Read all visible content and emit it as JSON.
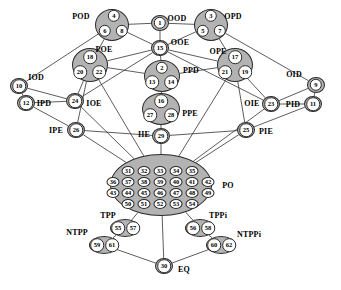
{
  "diagram": {
    "canvas": {
      "width": 341,
      "height": 290
    },
    "style": {
      "node_fill": "#b3b3b3",
      "node_stroke": "#2b2b2b",
      "cell_fill": "#ffffff",
      "edge_color": "#333333",
      "background": "#ffffff"
    },
    "nodes": [
      {
        "id": "OOD",
        "label": "OOD",
        "label_x": 177,
        "label_y": 19,
        "cx": 160,
        "cy": 23,
        "rx": 9,
        "ry": 8,
        "cells": [
          {
            "t": "1",
            "x": 160,
            "y": 23,
            "r": 6.2
          }
        ]
      },
      {
        "id": "POD",
        "label": "POD",
        "label_x": 81,
        "label_y": 17,
        "cx": 112,
        "cy": 25,
        "rx": 17,
        "ry": 16,
        "cells": [
          {
            "t": "4",
            "x": 114,
            "y": 16,
            "r": 6.2
          },
          {
            "t": "6",
            "x": 105,
            "y": 31,
            "r": 6.2
          },
          {
            "t": "8",
            "x": 122,
            "y": 31,
            "r": 6.2
          }
        ]
      },
      {
        "id": "OPD",
        "label": "OPD",
        "label_x": 233,
        "label_y": 17,
        "cx": 211,
        "cy": 25,
        "rx": 17,
        "ry": 16,
        "cells": [
          {
            "t": "3",
            "x": 211,
            "y": 16,
            "r": 6.2
          },
          {
            "t": "5",
            "x": 203,
            "y": 31,
            "r": 6.2
          },
          {
            "t": "7",
            "x": 220,
            "y": 31,
            "r": 6.2
          }
        ]
      },
      {
        "id": "OOE",
        "label": "OOE",
        "label_x": 180,
        "label_y": 43,
        "cx": 160,
        "cy": 48,
        "rx": 9,
        "ry": 8,
        "cells": [
          {
            "t": "15",
            "x": 160,
            "y": 48,
            "r": 6.8
          }
        ]
      },
      {
        "id": "POE",
        "label": "POE",
        "label_x": 104,
        "label_y": 50,
        "cx": 90,
        "cy": 65,
        "rx": 18,
        "ry": 17,
        "cells": [
          {
            "t": "18",
            "x": 90,
            "y": 57,
            "r": 6.8
          },
          {
            "t": "20",
            "x": 80,
            "y": 72,
            "r": 6.8
          },
          {
            "t": "22",
            "x": 99,
            "y": 72,
            "r": 6.8
          }
        ]
      },
      {
        "id": "OPE",
        "label": "OPE",
        "label_x": 218,
        "label_y": 52,
        "cx": 235,
        "cy": 65,
        "rx": 18,
        "ry": 17,
        "cells": [
          {
            "t": "17",
            "x": 235,
            "y": 57,
            "r": 6.8
          },
          {
            "t": "21",
            "x": 225,
            "y": 72,
            "r": 6.8
          },
          {
            "t": "19",
            "x": 245,
            "y": 72,
            "r": 6.8
          }
        ]
      },
      {
        "id": "PPD",
        "label": "PPD",
        "label_x": 191,
        "label_y": 71,
        "cx": 162,
        "cy": 76,
        "rx": 18,
        "ry": 16,
        "cells": [
          {
            "t": "2",
            "x": 162,
            "y": 68,
            "r": 6.2
          },
          {
            "t": "13",
            "x": 152,
            "y": 82,
            "r": 6.8
          },
          {
            "t": "14",
            "x": 171,
            "y": 82,
            "r": 6.8
          }
        ]
      },
      {
        "id": "IOD",
        "label": "IOD",
        "label_x": 36,
        "label_y": 78,
        "cx": 19,
        "cy": 86,
        "rx": 9,
        "ry": 8,
        "cells": [
          {
            "t": "10",
            "x": 19,
            "y": 86,
            "r": 6.8
          }
        ]
      },
      {
        "id": "OID",
        "label": "OID",
        "label_x": 294,
        "label_y": 75,
        "cx": 316,
        "cy": 85,
        "rx": 9,
        "ry": 8,
        "cells": [
          {
            "t": "9",
            "x": 316,
            "y": 85,
            "r": 6.2
          }
        ]
      },
      {
        "id": "PPE",
        "label": "PPE",
        "label_x": 190,
        "label_y": 114,
        "cx": 161,
        "cy": 109,
        "rx": 19,
        "ry": 16,
        "cells": [
          {
            "t": "16",
            "x": 161,
            "y": 101,
            "r": 6.8
          },
          {
            "t": "27",
            "x": 150,
            "y": 115,
            "r": 6.8
          },
          {
            "t": "28",
            "x": 171,
            "y": 115,
            "r": 6.8
          }
        ]
      },
      {
        "id": "IPD",
        "label": "IPD",
        "label_x": 44,
        "label_y": 104,
        "cx": 26,
        "cy": 103,
        "rx": 9,
        "ry": 8,
        "cells": [
          {
            "t": "12",
            "x": 26,
            "y": 103,
            "r": 6.8
          }
        ]
      },
      {
        "id": "IOE",
        "label": "IOE",
        "label_x": 94,
        "label_y": 104,
        "cx": 75,
        "cy": 101,
        "rx": 9,
        "ry": 8,
        "cells": [
          {
            "t": "24",
            "x": 75,
            "y": 101,
            "r": 6.8
          }
        ]
      },
      {
        "id": "OIE",
        "label": "OIE",
        "label_x": 252,
        "label_y": 104,
        "cx": 271,
        "cy": 104,
        "rx": 9,
        "ry": 8,
        "cells": [
          {
            "t": "23",
            "x": 271,
            "y": 104,
            "r": 6.8
          }
        ]
      },
      {
        "id": "PID",
        "label": "PID",
        "label_x": 293,
        "label_y": 105,
        "cx": 313,
        "cy": 104,
        "rx": 9,
        "ry": 8,
        "cells": [
          {
            "t": "11",
            "x": 313,
            "y": 104,
            "r": 6.8
          }
        ]
      },
      {
        "id": "IIE",
        "label": "IIE",
        "label_x": 144,
        "label_y": 135,
        "cx": 161,
        "cy": 136,
        "rx": 9,
        "ry": 8,
        "cells": [
          {
            "t": "29",
            "x": 161,
            "y": 136,
            "r": 6.8
          }
        ]
      },
      {
        "id": "IPE",
        "label": "IPE",
        "label_x": 56,
        "label_y": 131,
        "cx": 76,
        "cy": 130,
        "rx": 9,
        "ry": 8,
        "cells": [
          {
            "t": "26",
            "x": 76,
            "y": 130,
            "r": 6.8
          }
        ]
      },
      {
        "id": "PIE",
        "label": "PIE",
        "label_x": 266,
        "label_y": 132,
        "cx": 246,
        "cy": 130,
        "rx": 9,
        "ry": 8,
        "cells": [
          {
            "t": "25",
            "x": 246,
            "y": 130,
            "r": 6.8
          }
        ]
      },
      {
        "id": "PO",
        "label": "PO",
        "label_x": 228,
        "label_y": 186,
        "cx": 161,
        "cy": 185,
        "rx": 51,
        "ry": 31,
        "cells": []
      },
      {
        "id": "TPP",
        "label": "TPP",
        "label_x": 108,
        "label_y": 216,
        "cx": 125,
        "cy": 228,
        "rx": 15,
        "ry": 9,
        "cells": [
          {
            "t": "55",
            "x": 118,
            "y": 228,
            "r": 6.8
          },
          {
            "t": "57",
            "x": 133,
            "y": 228,
            "r": 6.8
          }
        ]
      },
      {
        "id": "TPPi",
        "label": "TPPi",
        "label_x": 218,
        "label_y": 216,
        "cx": 200,
        "cy": 228,
        "rx": 15,
        "ry": 9,
        "cells": [
          {
            "t": "56",
            "x": 193,
            "y": 228,
            "r": 6.8
          },
          {
            "t": "58",
            "x": 208,
            "y": 228,
            "r": 6.8
          }
        ]
      },
      {
        "id": "NTPP",
        "label": "NTPP",
        "label_x": 77,
        "label_y": 233,
        "cx": 104,
        "cy": 245,
        "rx": 15,
        "ry": 9,
        "cells": [
          {
            "t": "59",
            "x": 97,
            "y": 245,
            "r": 6.8
          },
          {
            "t": "61",
            "x": 112,
            "y": 245,
            "r": 6.8
          }
        ]
      },
      {
        "id": "NTPPi",
        "label": "NTPPi",
        "label_x": 249,
        "label_y": 235,
        "cx": 221,
        "cy": 245,
        "rx": 15,
        "ry": 9,
        "cells": [
          {
            "t": "60",
            "x": 214,
            "y": 245,
            "r": 6.8
          },
          {
            "t": "62",
            "x": 229,
            "y": 245,
            "r": 6.8
          }
        ]
      },
      {
        "id": "EQ",
        "label": "EQ",
        "label_x": 184,
        "label_y": 270,
        "cx": 164,
        "cy": 266,
        "rx": 9,
        "ry": 8,
        "cells": [
          {
            "t": "30",
            "x": 164,
            "y": 266,
            "r": 6.8
          }
        ]
      }
    ],
    "po_numbers": [
      {
        "t": "31",
        "x": 128,
        "y": 171
      },
      {
        "t": "32",
        "x": 144,
        "y": 171
      },
      {
        "t": "33",
        "x": 160,
        "y": 171
      },
      {
        "t": "34",
        "x": 176,
        "y": 171
      },
      {
        "t": "35",
        "x": 192,
        "y": 171
      },
      {
        "t": "36",
        "x": 113,
        "y": 182
      },
      {
        "t": "37",
        "x": 128,
        "y": 182
      },
      {
        "t": "38",
        "x": 144,
        "y": 182
      },
      {
        "t": "39",
        "x": 160,
        "y": 182
      },
      {
        "t": "40",
        "x": 176,
        "y": 182
      },
      {
        "t": "41",
        "x": 192,
        "y": 182
      },
      {
        "t": "42",
        "x": 208,
        "y": 182
      },
      {
        "t": "43",
        "x": 113,
        "y": 193
      },
      {
        "t": "44",
        "x": 128,
        "y": 193
      },
      {
        "t": "45",
        "x": 144,
        "y": 193
      },
      {
        "t": "46",
        "x": 160,
        "y": 193
      },
      {
        "t": "47",
        "x": 176,
        "y": 193
      },
      {
        "t": "48",
        "x": 192,
        "y": 193
      },
      {
        "t": "49",
        "x": 208,
        "y": 193
      },
      {
        "t": "50",
        "x": 128,
        "y": 204
      },
      {
        "t": "51",
        "x": 144,
        "y": 204
      },
      {
        "t": "52",
        "x": 160,
        "y": 204
      },
      {
        "t": "53",
        "x": 176,
        "y": 204
      },
      {
        "t": "54",
        "x": 192,
        "y": 204
      }
    ],
    "edges": [
      {
        "from": "POD",
        "to": "OOD"
      },
      {
        "from": "OOD",
        "to": "OPD"
      },
      {
        "from": "OOD",
        "to": "OOE"
      },
      {
        "from": "POD",
        "to": "POE"
      },
      {
        "from": "POD",
        "to": "IOD"
      },
      {
        "from": "POD",
        "to": "OOE"
      },
      {
        "from": "OPD",
        "to": "OPE"
      },
      {
        "from": "OPD",
        "to": "OID"
      },
      {
        "from": "OPD",
        "to": "OOE"
      },
      {
        "from": "OOE",
        "to": "POE"
      },
      {
        "from": "OOE",
        "to": "OPE"
      },
      {
        "from": "OOE",
        "to": "PPD"
      },
      {
        "from": "OOE",
        "to": "IOE"
      },
      {
        "from": "OOE",
        "to": "OIE"
      },
      {
        "from": "POE",
        "to": "PPD"
      },
      {
        "from": "OPE",
        "to": "PPD"
      },
      {
        "from": "POE",
        "to": "IOE"
      },
      {
        "from": "POE",
        "to": "IPE"
      },
      {
        "from": "OPE",
        "to": "OIE"
      },
      {
        "from": "OPE",
        "to": "PIE"
      },
      {
        "from": "IOD",
        "to": "IPD"
      },
      {
        "from": "IOD",
        "to": "IOE"
      },
      {
        "from": "OID",
        "to": "PID"
      },
      {
        "from": "OID",
        "to": "OIE"
      },
      {
        "from": "IPD",
        "to": "IPE"
      },
      {
        "from": "PID",
        "to": "PIE"
      },
      {
        "from": "IPD",
        "to": "IOE"
      },
      {
        "from": "PID",
        "to": "OIE"
      },
      {
        "from": "PPD",
        "to": "PPE"
      },
      {
        "from": "PPE",
        "to": "IIE"
      },
      {
        "from": "IOE",
        "to": "PO"
      },
      {
        "from": "OIE",
        "to": "PO"
      },
      {
        "from": "IPE",
        "to": "PO"
      },
      {
        "from": "PIE",
        "to": "PO"
      },
      {
        "from": "IIE",
        "to": "PO"
      },
      {
        "from": "POE",
        "to": "PO"
      },
      {
        "from": "OPE",
        "to": "PO"
      },
      {
        "from": "IPE",
        "to": "IIE"
      },
      {
        "from": "PIE",
        "to": "IIE"
      },
      {
        "from": "PO",
        "to": "TPP"
      },
      {
        "from": "PO",
        "to": "TPPi"
      },
      {
        "from": "PO",
        "to": "EQ"
      },
      {
        "from": "TPP",
        "to": "NTPP"
      },
      {
        "from": "TPPi",
        "to": "NTPPi"
      },
      {
        "from": "NTPP",
        "to": "EQ"
      },
      {
        "from": "NTPPi",
        "to": "EQ"
      }
    ]
  }
}
